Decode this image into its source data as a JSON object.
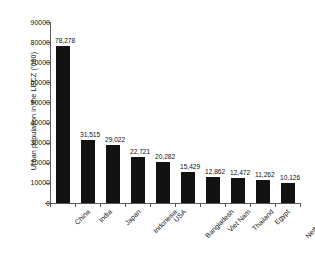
{
  "chart_data": {
    "type": "bar",
    "title": "",
    "subtitle": "",
    "xlabel": "",
    "ylabel": "Urban population in the LECZ ('000)",
    "ylim": [
      0,
      90000
    ],
    "ytick_labels": [
      "0",
      "10000",
      "20000",
      "30000",
      "40000",
      "50000",
      "60000",
      "70000",
      "80000",
      "90000"
    ],
    "ytick_values": [
      0,
      10000,
      20000,
      30000,
      40000,
      50000,
      60000,
      70000,
      80000,
      90000
    ],
    "grid": false,
    "legend": false,
    "legend_position": "none",
    "bar_color": "#121212",
    "axis_color": "#5a5a5a",
    "background_color": "#ffffff",
    "categories": [
      "China",
      "India",
      "Japan",
      "Indonesia",
      "USA",
      "Bangladesh",
      "Viet Nam",
      "Thailand",
      "Egypt",
      "Netherlands"
    ],
    "values": [
      78278,
      31515,
      29022,
      22721,
      20282,
      15429,
      12862,
      12472,
      11262,
      10126
    ],
    "data_labels": [
      "78,278",
      "31,515",
      "29,022",
      "22,721",
      "20,282",
      "15,429",
      "12,862",
      "12,472",
      "11,262",
      "10,126"
    ]
  }
}
